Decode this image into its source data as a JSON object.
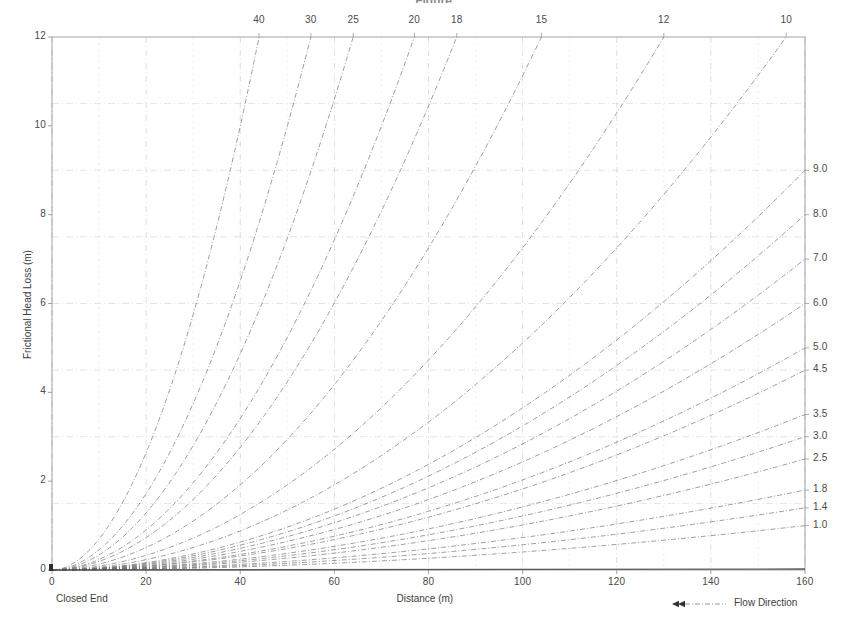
{
  "figure": {
    "title_fragment": "Figure",
    "background": "#ffffff",
    "ink_color": "#6d6d6d",
    "grid_color": "#c9c9c9",
    "frame_color": "#9a9a9a",
    "text_color": "#3d3d3d"
  },
  "axes": {
    "x": {
      "label": "Distance (m)",
      "ticks": [
        "0",
        "20",
        "40",
        "60",
        "80",
        "100",
        "120",
        "140",
        "160"
      ],
      "tick_values": [
        0,
        20,
        40,
        60,
        80,
        100,
        120,
        140,
        160
      ],
      "range": [
        0,
        160
      ],
      "minor_step": 10
    },
    "y_left": {
      "label": "Frictional Head Loss (m)",
      "ticks": [
        "0",
        "2",
        "4",
        "6",
        "8",
        "10",
        "12"
      ],
      "tick_values": [
        0,
        2,
        4,
        6,
        8,
        10,
        12
      ],
      "range": [
        0,
        12
      ],
      "grid_values": [
        0,
        1.5,
        3,
        4.5,
        6,
        7.5,
        9,
        10.5,
        12
      ]
    },
    "y_right": {
      "label": "",
      "ticks": [
        "9.0",
        "8.0",
        "7.0",
        "6.0",
        "5.0",
        "4.5",
        "3.5",
        "3.0",
        "2.5",
        "1.8",
        "1.4",
        "1.0"
      ],
      "tick_values": [
        9.0,
        8.0,
        7.0,
        6.0,
        5.0,
        4.5,
        3.5,
        3.0,
        2.5,
        1.8,
        1.4,
        1.0
      ]
    },
    "x_top": {
      "label": "",
      "ticks": [
        "40",
        "30",
        "25",
        "20",
        "18",
        "15",
        "12",
        "10"
      ],
      "tick_values": [
        40,
        30,
        25,
        20,
        18,
        15,
        12,
        10
      ]
    }
  },
  "annotations": {
    "closed_end": "Closed End",
    "flow_direction": "Flow Direction",
    "flow_arrow": "double-left-arrow"
  },
  "chart_data": {
    "type": "line",
    "xlabel": "Distance (m)",
    "ylabel": "Frictional Head Loss (m)",
    "xlim": [
      0,
      160
    ],
    "ylim": [
      0,
      12
    ],
    "grid": true,
    "legend": "curve-end-labels",
    "x": [
      0,
      10,
      20,
      30,
      40,
      50,
      60,
      70,
      80,
      90,
      100,
      110,
      120,
      130,
      140,
      150,
      160
    ],
    "series": [
      {
        "name": "40",
        "label_position": "top",
        "label_x": 40,
        "end_x": 44,
        "end_y": 12,
        "values": [
          0,
          0.1,
          0.45,
          1.05,
          1.9,
          3.0,
          4.35,
          5.95,
          7.8,
          9.9,
          12.0,
          null,
          null,
          null,
          null,
          null,
          null
        ]
      },
      {
        "name": "30",
        "label_position": "top",
        "label_x": 30,
        "end_x": 55,
        "end_y": 12,
        "values": [
          0,
          0.07,
          0.3,
          0.7,
          1.28,
          2.02,
          2.95,
          4.05,
          5.35,
          6.82,
          8.48,
          10.3,
          12.0,
          null,
          null,
          null,
          null
        ]
      },
      {
        "name": "25",
        "label_position": "top",
        "label_x": 25,
        "end_x": 64,
        "end_y": 12,
        "values": [
          0,
          0.05,
          0.22,
          0.52,
          0.95,
          1.52,
          2.22,
          3.05,
          4.05,
          5.18,
          6.45,
          7.88,
          9.45,
          11.2,
          12.0,
          null,
          null
        ]
      },
      {
        "name": "20",
        "label_position": "top",
        "label_x": 20,
        "end_x": 77,
        "end_y": 12,
        "values": [
          0,
          0.035,
          0.15,
          0.36,
          0.66,
          1.05,
          1.54,
          2.12,
          2.82,
          3.62,
          4.52,
          5.53,
          6.65,
          7.9,
          9.25,
          10.7,
          12.0
        ]
      },
      {
        "name": "18",
        "label_position": "top",
        "label_x": 18,
        "end_x": 86,
        "end_y": 12,
        "values": [
          0,
          0.029,
          0.125,
          0.295,
          0.545,
          0.87,
          1.28,
          1.76,
          2.34,
          3.0,
          3.76,
          4.6,
          5.54,
          6.57,
          7.7,
          8.92,
          10.25
        ]
      },
      {
        "name": "15",
        "label_position": "top",
        "label_x": 15,
        "end_x": 104,
        "end_y": 12,
        "values": [
          0,
          0.022,
          0.095,
          0.225,
          0.415,
          0.66,
          0.97,
          1.34,
          1.78,
          2.29,
          2.86,
          3.5,
          4.22,
          5.0,
          5.86,
          6.79,
          7.8
        ]
      },
      {
        "name": "12",
        "label_position": "top",
        "label_x": 12,
        "end_x": 130,
        "end_y": 12,
        "values": [
          0,
          0.016,
          0.068,
          0.162,
          0.298,
          0.475,
          0.7,
          0.965,
          1.28,
          1.65,
          2.06,
          2.52,
          3.04,
          3.6,
          4.22,
          4.89,
          5.62
        ]
      },
      {
        "name": "10",
        "label_position": "top",
        "label_x": 10,
        "end_x": 156,
        "end_y": 12,
        "values": [
          0,
          0.012,
          0.052,
          0.122,
          0.225,
          0.358,
          0.527,
          0.727,
          0.965,
          1.24,
          1.55,
          1.9,
          2.29,
          2.71,
          3.18,
          3.69,
          4.23
        ]
      },
      {
        "name": "9.0",
        "label_position": "right",
        "end_x": 160,
        "end_y": 9.0,
        "values": [
          0,
          0.051,
          0.205,
          0.465,
          0.82,
          1.28,
          1.85,
          2.51,
          3.28,
          4.15,
          5.12,
          6.19,
          7.36,
          8.63,
          10.0,
          11.5,
          12.0
        ]
      },
      {
        "name": "8.0",
        "label_position": "right",
        "end_x": 160,
        "end_y": 8.0,
        "values": [
          0,
          0.041,
          0.165,
          0.372,
          0.66,
          1.03,
          1.48,
          2.02,
          2.63,
          3.33,
          4.11,
          4.97,
          5.91,
          6.93,
          8.04,
          9.22,
          10.5
        ]
      },
      {
        "name": "7.0",
        "label_position": "right",
        "end_x": 160,
        "end_y": 7.0,
        "values": [
          0,
          0.032,
          0.129,
          0.29,
          0.515,
          0.8,
          1.16,
          1.58,
          2.06,
          2.6,
          3.21,
          3.88,
          4.62,
          5.42,
          6.28,
          7.21,
          8.2
        ]
      },
      {
        "name": "6.0",
        "label_position": "right",
        "end_x": 160,
        "end_y": 6.0,
        "values": [
          0,
          0.024,
          0.097,
          0.218,
          0.386,
          0.6,
          0.87,
          1.18,
          1.54,
          1.95,
          2.41,
          2.91,
          3.46,
          4.06,
          4.71,
          5.4,
          6.15
        ]
      },
      {
        "name": "5.0",
        "label_position": "right",
        "end_x": 160,
        "end_y": 5.0,
        "values": [
          0,
          0.017,
          0.07,
          0.157,
          0.279,
          0.435,
          0.627,
          0.853,
          1.11,
          1.41,
          1.74,
          2.11,
          2.5,
          2.93,
          3.4,
          3.9,
          4.44
        ]
      },
      {
        "name": "4.5",
        "label_position": "right",
        "end_x": 160,
        "end_y": 4.5,
        "values": [
          0,
          0.014,
          0.058,
          0.13,
          0.231,
          0.361,
          0.52,
          0.707,
          0.924,
          1.17,
          1.44,
          1.75,
          2.08,
          2.43,
          2.82,
          3.24,
          3.68
        ]
      },
      {
        "name": "3.5",
        "label_position": "right",
        "end_x": 160,
        "end_y": 3.5,
        "values": [
          0,
          0.009,
          0.037,
          0.084,
          0.149,
          0.233,
          0.335,
          0.456,
          0.596,
          0.754,
          0.931,
          1.13,
          1.34,
          1.57,
          1.82,
          2.09,
          2.38
        ]
      },
      {
        "name": "3.0",
        "label_position": "right",
        "end_x": 160,
        "end_y": 3.0,
        "values": [
          0,
          0.007,
          0.028,
          0.063,
          0.112,
          0.175,
          0.252,
          0.343,
          0.448,
          0.567,
          0.7,
          0.847,
          1.01,
          1.18,
          1.37,
          1.57,
          1.79
        ]
      },
      {
        "name": "2.5",
        "label_position": "right",
        "end_x": 160,
        "end_y": 2.5,
        "values": [
          0,
          0.005,
          0.02,
          0.045,
          0.08,
          0.125,
          0.18,
          0.245,
          0.32,
          0.405,
          0.5,
          0.605,
          0.72,
          0.845,
          0.98,
          1.125,
          1.28
        ]
      },
      {
        "name": "1.8",
        "label_position": "right",
        "end_x": 160,
        "end_y": 1.8,
        "values": [
          0,
          0.0027,
          0.011,
          0.024,
          0.043,
          0.067,
          0.097,
          0.132,
          0.172,
          0.218,
          0.269,
          0.326,
          0.388,
          0.455,
          0.528,
          0.606,
          0.69
        ]
      },
      {
        "name": "1.4",
        "label_position": "right",
        "end_x": 160,
        "end_y": 1.4,
        "values": [
          0,
          0.0017,
          0.0068,
          0.0153,
          0.027,
          0.043,
          0.061,
          0.083,
          0.109,
          0.138,
          0.17,
          0.206,
          0.245,
          0.288,
          0.334,
          0.383,
          0.436
        ]
      },
      {
        "name": "1.0",
        "label_position": "right",
        "end_x": 160,
        "end_y": 1.0,
        "values": [
          0,
          0.0009,
          0.0035,
          0.0079,
          0.014,
          0.022,
          0.032,
          0.043,
          0.056,
          0.071,
          0.088,
          0.106,
          0.127,
          0.149,
          0.173,
          0.198,
          0.225
        ]
      }
    ]
  }
}
